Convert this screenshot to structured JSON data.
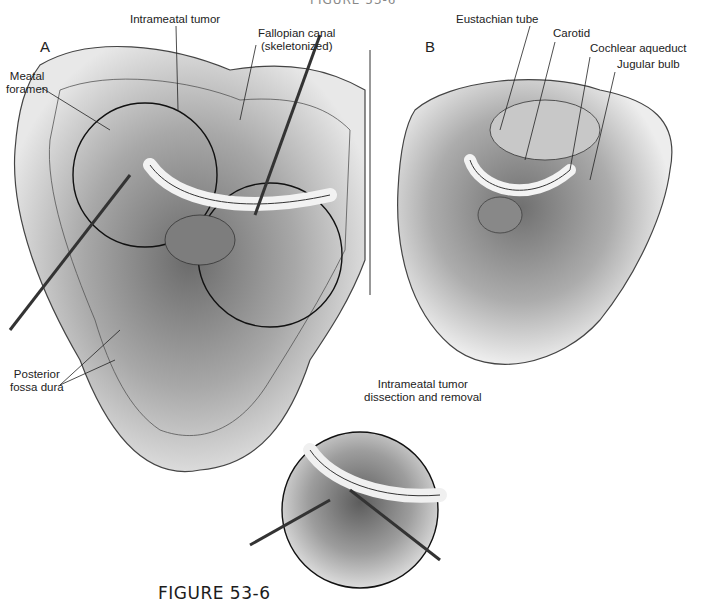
{
  "figure": {
    "caption": "FIGURE 53-6",
    "top_cut_text": "FIGURE 53-6",
    "panels": {
      "a": {
        "letter": "A",
        "labels": {
          "intrameatal_tumor": "Intrameatal tumor",
          "fallopian_canal_line1": "Fallopian canal",
          "fallopian_canal_line2": "(skeletonized)",
          "meatal_foramen_line1": "Meatal",
          "meatal_foramen_line2": "foramen",
          "posterior_fossa_line1": "Posterior",
          "posterior_fossa_line2": "fossa dura"
        }
      },
      "b": {
        "letter": "B",
        "labels": {
          "eustachian_tube": "Eustachian tube",
          "carotid": "Carotid",
          "cochlear_aqueduct": "Cochlear aqueduct",
          "jugular_bulb": "Jugular bulb"
        }
      },
      "inset": {
        "labels": {
          "line1": "Intrameatal tumor",
          "line2": "dissection and removal"
        }
      }
    }
  }
}
